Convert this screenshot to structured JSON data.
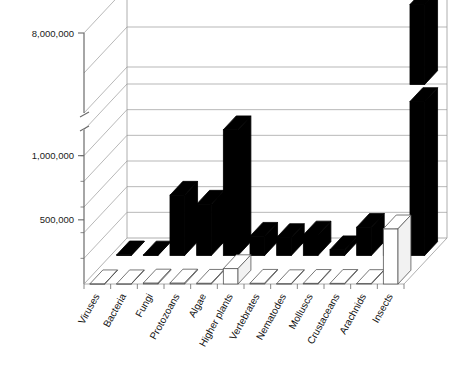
{
  "chart_data": {
    "type": "bar",
    "title": "",
    "subtitle": "",
    "xlabel": "",
    "ylabel": "",
    "projection": "3d-two-row",
    "grid": true,
    "legend_position": "none",
    "axis_break": {
      "present": true,
      "below": 1200000,
      "above": 7000000,
      "note": "y-axis broken between the 1,000,000 band and the 8,000,000 tick"
    },
    "ylim": [
      0,
      8000000
    ],
    "ytick_labels": [
      "500,000",
      "1,000,000",
      "8,000,000"
    ],
    "ytick_values": [
      500000,
      1000000,
      8000000
    ],
    "categories": [
      "Viruses",
      "Bacteria",
      "Fungi",
      "Protozoans",
      "Algae",
      "Higher plants",
      "Vertebrates",
      "Nematodes",
      "Molluscs",
      "Crustaceans",
      "Arachnids",
      "Insects"
    ],
    "series": [
      {
        "name": "described species",
        "color": "#000000",
        "style": "solid-black",
        "row": "back",
        "values": [
          5000,
          4000,
          470000,
          400000,
          980000,
          150000,
          140000,
          160000,
          45000,
          220000,
          110000,
          75000
        ]
      },
      {
        "name": "estimated species",
        "color": "#ffffff",
        "style": "hollow-white",
        "row": "front",
        "values": [
          2000,
          2000,
          8000,
          8000,
          6000,
          120000,
          6000,
          3000,
          5000,
          5000,
          4000,
          430000
        ]
      }
    ],
    "broken_bars": [
      {
        "category": "Insects",
        "series": "described species",
        "upper_segment_top": 8000000,
        "note": "black Insects bar continues above the axis break"
      }
    ]
  },
  "yaxis": {
    "labels": [
      {
        "text": "8,000,000",
        "value": 8000000
      },
      {
        "text": "1,000,000",
        "value": 1000000
      },
      {
        "text": "500,000",
        "value": 500000
      }
    ]
  },
  "xaxis": {
    "labels": [
      "Viruses",
      "Bacteria",
      "Fungi",
      "Protozoans",
      "Algae",
      "Higher plants",
      "Vertebrates",
      "Nematodes",
      "Molluscs",
      "Crustaceans",
      "Arachnids",
      "Insects"
    ]
  },
  "colors": {
    "bar_dark": "#000000",
    "bar_light": "#ffffff",
    "outline": "#555555",
    "grid": "#9a9a9a",
    "axis": "#6b6b6b",
    "text": "#111111",
    "background": "#ffffff"
  }
}
